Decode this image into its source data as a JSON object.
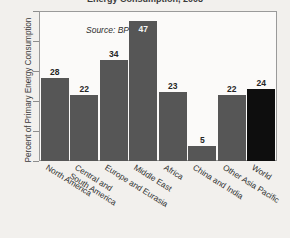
{
  "figure": {
    "title_partial": "Energy Consumption, 2008",
    "source_note": "Source: BP"
  },
  "chart_data": {
    "type": "bar",
    "title": "",
    "xlabel": "",
    "ylabel": "Percent of Primary Energy Consumption",
    "categories": [
      "North America",
      "Central and\nSouth America",
      "Europe and Eurasia",
      "Middle East",
      "Africa",
      "China and India",
      "Other Asia Pacific",
      "World"
    ],
    "category_lines": [
      [
        "North America"
      ],
      [
        "Central and",
        "South America"
      ],
      [
        "Europe and Eurasia"
      ],
      [
        "Middle East"
      ],
      [
        "Africa"
      ],
      [
        "China and India"
      ],
      [
        "Other Asia Pacific"
      ],
      [
        "World"
      ]
    ],
    "values": [
      28,
      22,
      34,
      47,
      23,
      5,
      22,
      24
    ],
    "ylim": [
      0,
      50
    ],
    "yticks": [
      0,
      10,
      20,
      30,
      40,
      50
    ],
    "ytick_labels": [
      "0",
      "10",
      "20",
      "30",
      "40",
      "50"
    ],
    "grid": false,
    "legend": "none",
    "bar_colors": [
      "#565656",
      "#565656",
      "#565656",
      "#565656",
      "#565656",
      "#565656",
      "#565656",
      "#0e0e0e"
    ],
    "highlight_index": 7,
    "annotations": [
      "Source: BP"
    ]
  },
  "colors": {
    "bar": "#565656",
    "bar_highlight": "#0e0e0e",
    "plot_background": "#fbfaf9",
    "page_background": "#f2f0ed",
    "axis": "#9a9a9a",
    "text": "#2f2f2f"
  }
}
